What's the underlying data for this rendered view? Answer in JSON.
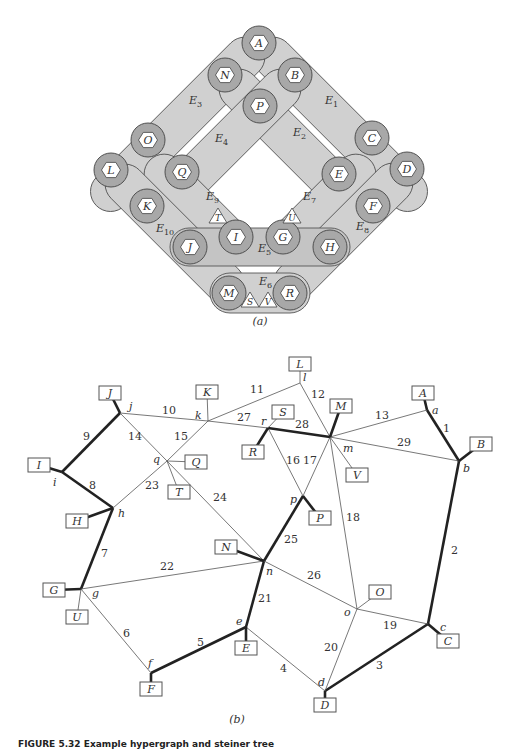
{
  "figure_a": {
    "caption": "(a)",
    "hyperedges": [
      {
        "id": "E1",
        "label": "E",
        "sub": "1",
        "x": 325,
        "y": 104
      },
      {
        "id": "E2",
        "label": "E",
        "sub": "2",
        "x": 293,
        "y": 136
      },
      {
        "id": "E3",
        "label": "E",
        "sub": "3",
        "x": 189,
        "y": 104
      },
      {
        "id": "E4",
        "label": "E",
        "sub": "4",
        "x": 215,
        "y": 142
      },
      {
        "id": "E5",
        "label": "E",
        "sub": "5",
        "x": 258,
        "y": 252
      },
      {
        "id": "E6",
        "label": "E",
        "sub": "6",
        "x": 259,
        "y": 285
      },
      {
        "id": "E7",
        "label": "E",
        "sub": "7",
        "x": 303,
        "y": 200
      },
      {
        "id": "E8",
        "label": "E",
        "sub": "8",
        "x": 356,
        "y": 230
      },
      {
        "id": "E9",
        "label": "E",
        "sub": "9",
        "x": 206,
        "y": 200
      },
      {
        "id": "E10",
        "label": "E",
        "sub": "10",
        "x": 156,
        "y": 232
      }
    ],
    "hex_nodes": [
      {
        "id": "A",
        "x": 259,
        "y": 43
      },
      {
        "id": "N",
        "x": 225,
        "y": 75
      },
      {
        "id": "B",
        "x": 295,
        "y": 75
      },
      {
        "id": "P",
        "x": 260,
        "y": 106
      },
      {
        "id": "O",
        "x": 148,
        "y": 140
      },
      {
        "id": "C",
        "x": 372,
        "y": 138
      },
      {
        "id": "L",
        "x": 111,
        "y": 170
      },
      {
        "id": "Q",
        "x": 182,
        "y": 172
      },
      {
        "id": "E",
        "x": 339,
        "y": 174
      },
      {
        "id": "D",
        "x": 407,
        "y": 169
      },
      {
        "id": "K",
        "x": 147,
        "y": 206
      },
      {
        "id": "F",
        "x": 373,
        "y": 206
      },
      {
        "id": "J",
        "x": 190,
        "y": 247
      },
      {
        "id": "I",
        "x": 236,
        "y": 237
      },
      {
        "id": "G",
        "x": 283,
        "y": 237
      },
      {
        "id": "H",
        "x": 330,
        "y": 247
      },
      {
        "id": "M",
        "x": 229,
        "y": 293
      },
      {
        "id": "R",
        "x": 290,
        "y": 293
      }
    ],
    "tri_nodes": [
      {
        "id": "T",
        "x": 218,
        "y": 217
      },
      {
        "id": "U",
        "x": 292,
        "y": 217
      },
      {
        "id": "S",
        "x": 250,
        "y": 301
      },
      {
        "id": "V",
        "x": 268,
        "y": 301
      }
    ]
  },
  "figure_b": {
    "caption": "(b)",
    "junctions": [
      {
        "id": "a",
        "x": 427,
        "y": 410,
        "lx": 432,
        "ly": 414
      },
      {
        "id": "b",
        "x": 459,
        "y": 461,
        "lx": 463,
        "ly": 472
      },
      {
        "id": "c",
        "x": 428,
        "y": 624,
        "lx": 440,
        "ly": 631
      },
      {
        "id": "d",
        "x": 325,
        "y": 691,
        "lx": 318,
        "ly": 686
      },
      {
        "id": "e",
        "x": 246,
        "y": 627,
        "lx": 236,
        "ly": 625
      },
      {
        "id": "f",
        "x": 151,
        "y": 673,
        "lx": 148,
        "ly": 667
      },
      {
        "id": "g",
        "x": 81,
        "y": 589,
        "lx": 92,
        "ly": 597
      },
      {
        "id": "h",
        "x": 113,
        "y": 508,
        "lx": 118,
        "ly": 517
      },
      {
        "id": "i",
        "x": 62,
        "y": 472,
        "lx": 53,
        "ly": 486
      },
      {
        "id": "j",
        "x": 120,
        "y": 413,
        "lx": 129,
        "ly": 410
      },
      {
        "id": "k",
        "x": 208,
        "y": 421,
        "lx": 195,
        "ly": 419
      },
      {
        "id": "l",
        "x": 300,
        "y": 383,
        "lx": 303,
        "ly": 381
      },
      {
        "id": "m",
        "x": 330,
        "y": 437,
        "lx": 343,
        "ly": 452
      },
      {
        "id": "n",
        "x": 264,
        "y": 561,
        "lx": 266,
        "ly": 575
      },
      {
        "id": "o",
        "x": 357,
        "y": 609,
        "lx": 344,
        "ly": 616
      },
      {
        "id": "p",
        "x": 303,
        "y": 496,
        "lx": 290,
        "ly": 503
      },
      {
        "id": "q",
        "x": 167,
        "y": 461,
        "lx": 153,
        "ly": 463
      },
      {
        "id": "r",
        "x": 268,
        "y": 428,
        "lx": 261,
        "ly": 425
      }
    ],
    "terminals": [
      {
        "id": "A",
        "x": 423,
        "y": 393
      },
      {
        "id": "B",
        "x": 481,
        "y": 444
      },
      {
        "id": "C",
        "x": 448,
        "y": 641
      },
      {
        "id": "D",
        "x": 325,
        "y": 705
      },
      {
        "id": "E",
        "x": 246,
        "y": 648
      },
      {
        "id": "F",
        "x": 151,
        "y": 689
      },
      {
        "id": "G",
        "x": 54,
        "y": 590
      },
      {
        "id": "H",
        "x": 77,
        "y": 521
      },
      {
        "id": "I",
        "x": 39,
        "y": 465
      },
      {
        "id": "J",
        "x": 110,
        "y": 393
      },
      {
        "id": "K",
        "x": 207,
        "y": 392
      },
      {
        "id": "L",
        "x": 300,
        "y": 364
      },
      {
        "id": "M",
        "x": 341,
        "y": 406
      },
      {
        "id": "N",
        "x": 226,
        "y": 547
      },
      {
        "id": "O",
        "x": 380,
        "y": 592
      },
      {
        "id": "P",
        "x": 320,
        "y": 518
      },
      {
        "id": "Q",
        "x": 196,
        "y": 462
      },
      {
        "id": "R",
        "x": 253,
        "y": 452
      },
      {
        "id": "S",
        "x": 283,
        "y": 412
      },
      {
        "id": "T",
        "x": 179,
        "y": 492
      },
      {
        "id": "U",
        "x": 77,
        "y": 617
      },
      {
        "id": "V",
        "x": 357,
        "y": 475
      }
    ],
    "edges": [
      {
        "label": "1",
        "from": "a",
        "to": "b",
        "bold": true,
        "lx": 443,
        "ly": 432
      },
      {
        "label": "2",
        "from": "b",
        "to": "c",
        "bold": true,
        "lx": 451,
        "ly": 554
      },
      {
        "label": "3",
        "from": "c",
        "to": "d",
        "bold": true,
        "lx": 376,
        "ly": 669
      },
      {
        "label": "4",
        "from": "d",
        "to": "e",
        "bold": false,
        "lx": 280,
        "ly": 672
      },
      {
        "label": "5",
        "from": "e",
        "to": "f",
        "bold": true,
        "lx": 197,
        "ly": 646
      },
      {
        "label": "6",
        "from": "f",
        "to": "g",
        "bold": false,
        "lx": 123,
        "ly": 637
      },
      {
        "label": "7",
        "from": "g",
        "to": "h",
        "bold": true,
        "lx": 101,
        "ly": 557
      },
      {
        "label": "8",
        "from": "h",
        "to": "i",
        "bold": true,
        "lx": 89,
        "ly": 489
      },
      {
        "label": "9",
        "from": "i",
        "to": "j",
        "bold": true,
        "lx": 83,
        "ly": 440
      },
      {
        "label": "10",
        "from": "j",
        "to": "k",
        "bold": false,
        "lx": 162,
        "ly": 414
      },
      {
        "label": "11",
        "from": "k",
        "to": "l",
        "bold": false,
        "lx": 250,
        "ly": 393
      },
      {
        "label": "12",
        "from": "l",
        "to": "m",
        "bold": false,
        "lx": 311,
        "ly": 398
      },
      {
        "label": "13",
        "from": "m",
        "to": "a",
        "bold": false,
        "lx": 375,
        "ly": 419
      },
      {
        "label": "14",
        "from": "j",
        "to": "q",
        "bold": false,
        "lx": 128,
        "ly": 440
      },
      {
        "label": "15",
        "from": "k",
        "to": "q",
        "bold": false,
        "lx": 174,
        "ly": 440
      },
      {
        "label": "16",
        "from": "r",
        "to": "p",
        "bold": false,
        "lx": 286,
        "ly": 464
      },
      {
        "label": "17",
        "from": "m",
        "to": "p",
        "bold": false,
        "lx": 303,
        "ly": 464
      },
      {
        "label": "18",
        "from": "m",
        "to": "o",
        "bold": false,
        "lx": 346,
        "ly": 521
      },
      {
        "label": "19",
        "from": "o",
        "to": "c",
        "bold": false,
        "lx": 383,
        "ly": 629
      },
      {
        "label": "20",
        "from": "o",
        "to": "d",
        "bold": false,
        "lx": 324,
        "ly": 651
      },
      {
        "label": "21",
        "from": "n",
        "to": "e",
        "bold": true,
        "lx": 258,
        "ly": 602
      },
      {
        "label": "22",
        "from": "g",
        "to": "n",
        "bold": false,
        "lx": 160,
        "ly": 570
      },
      {
        "label": "23",
        "from": "q",
        "to": "h",
        "bold": false,
        "lx": 145,
        "ly": 489
      },
      {
        "label": "24",
        "from": "q",
        "to": "n",
        "bold": false,
        "lx": 213,
        "ly": 501
      },
      {
        "label": "25",
        "from": "p",
        "to": "n",
        "bold": true,
        "lx": 284,
        "ly": 543
      },
      {
        "label": "26",
        "from": "n",
        "to": "o",
        "bold": false,
        "lx": 307,
        "ly": 579
      },
      {
        "label": "27",
        "from": "k",
        "to": "r",
        "bold": false,
        "lx": 237,
        "ly": 421
      },
      {
        "label": "28",
        "from": "r",
        "to": "m",
        "bold": true,
        "lx": 295,
        "ly": 428
      },
      {
        "label": "29",
        "from": "m",
        "to": "b",
        "bold": false,
        "lx": 397,
        "ly": 446
      }
    ],
    "terminal_links": [
      {
        "terminal": "A",
        "junction": "a",
        "bold": true
      },
      {
        "terminal": "B",
        "junction": "b",
        "bold": true
      },
      {
        "terminal": "C",
        "junction": "c",
        "bold": true
      },
      {
        "terminal": "D",
        "junction": "d",
        "bold": true
      },
      {
        "terminal": "E",
        "junction": "e",
        "bold": true
      },
      {
        "terminal": "F",
        "junction": "f",
        "bold": true
      },
      {
        "terminal": "G",
        "junction": "g",
        "bold": true
      },
      {
        "terminal": "H",
        "junction": "h",
        "bold": true
      },
      {
        "terminal": "I",
        "junction": "i",
        "bold": true
      },
      {
        "terminal": "J",
        "junction": "j",
        "bold": true
      },
      {
        "terminal": "K",
        "junction": "k",
        "bold": false
      },
      {
        "terminal": "L",
        "junction": "l",
        "bold": false
      },
      {
        "terminal": "M",
        "junction": "m",
        "bold": true
      },
      {
        "terminal": "N",
        "junction": "n",
        "bold": true
      },
      {
        "terminal": "O",
        "junction": "o",
        "bold": false
      },
      {
        "terminal": "P",
        "junction": "p",
        "bold": true
      },
      {
        "terminal": "Q",
        "junction": "q",
        "bold": false
      },
      {
        "terminal": "R",
        "junction": "r",
        "bold": true
      },
      {
        "terminal": "S",
        "junction": "r",
        "bold": false
      },
      {
        "terminal": "T",
        "junction": "q",
        "bold": false
      },
      {
        "terminal": "U",
        "junction": "g",
        "bold": false
      },
      {
        "terminal": "V",
        "junction": "m",
        "bold": false
      }
    ]
  },
  "figure_caption": "FIGURE 5.32  Example hypergraph and steiner tree"
}
